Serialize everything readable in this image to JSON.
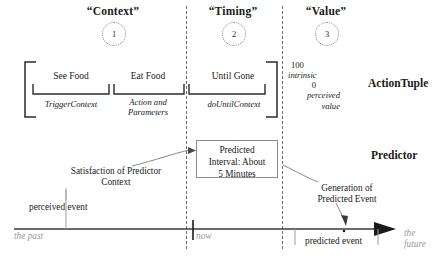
{
  "figure": {
    "columns": [
      {
        "title": "“Context”",
        "number": "1"
      },
      {
        "title": "“Timing”",
        "number": "2"
      },
      {
        "title": "“Value”",
        "number": "3"
      }
    ],
    "rows": [
      {
        "name": "ActionTuple"
      },
      {
        "name": "Predictor"
      }
    ],
    "action_tuple": {
      "slots": [
        {
          "label": "See Food",
          "sublabel": "TriggerContext"
        },
        {
          "label": "Eat Food",
          "sublabel_line1": "Action and",
          "sublabel_line2": "Parameters"
        },
        {
          "label": "Until Gone",
          "sublabel": "doUntilContext"
        }
      ],
      "value_scale": {
        "max": "100",
        "max_label": "intrinsic",
        "min": "0",
        "min_label_line1": "perceived",
        "min_label_line2": "value"
      }
    },
    "predictor": {
      "interval_box": {
        "line1": "Predicted",
        "line2": "Interval: About",
        "line3": "5 Minutes"
      },
      "annotations": [
        {
          "line1": "Satisfaction of Predictor",
          "line2": "Context"
        },
        {
          "line1": "Generation of",
          "line2": "Predicted Event"
        }
      ]
    },
    "timeline": {
      "past_label": "the past",
      "now_label": "now",
      "future_label_line1": "the",
      "future_label_line2": "future",
      "events": [
        {
          "label": "perceived event"
        },
        {
          "label": "predicted event"
        }
      ]
    },
    "colors": {
      "ink": "#1a1a1a",
      "axis": "#3a3a3a",
      "dashed_divider": "#6e6e6e",
      "muted_text": "#9a9a9a",
      "box_border": "#8d8d8d",
      "circle_border": "#8a8a8a",
      "background": "#ffffff"
    }
  }
}
